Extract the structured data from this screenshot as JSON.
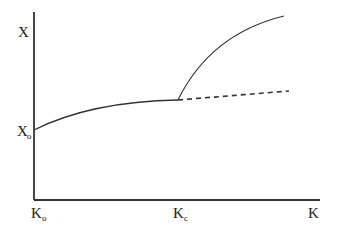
{
  "diagram": {
    "axes": {
      "y_label": "X",
      "y_origin_label": "X",
      "y_origin_subscript": "o",
      "x_origin_label": "K",
      "x_origin_subscript": "o",
      "x_critical_label": "K",
      "x_critical_subscript": "c",
      "x_label": "K"
    },
    "curves": [
      {
        "name": "base-curve",
        "style": "solid",
        "from": "X_o at K_o",
        "to": "K_c"
      },
      {
        "name": "upper-branch",
        "style": "solid",
        "from": "K_c",
        "direction": "rising steeply, concave"
      },
      {
        "name": "continued-branch",
        "style": "dashed",
        "from": "K_c",
        "direction": "slowly rising"
      }
    ],
    "colors": {
      "line": "#333333",
      "text": "#222222",
      "background": "#ffffff"
    }
  }
}
